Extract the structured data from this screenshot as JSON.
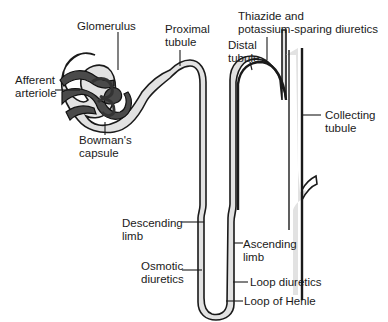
{
  "diagram": {
    "type": "anatomical-diagram",
    "labels": {
      "glomerulus": "Glomerulus",
      "proximal_1": "Proximal",
      "proximal_2": "tubule",
      "afferent_1": "Afferent",
      "afferent_2": "arteriole",
      "bowman_1": "Bowman's",
      "bowman_2": "capsule",
      "thiazide_1": "Thiazide and",
      "thiazide_2": "potassium-sparing diuretics",
      "distal_1": "Distal",
      "distal_2": "tubule",
      "collecting_1": "Collecting",
      "collecting_2": "tubule",
      "descending_1": "Descending",
      "descending_2": "limb",
      "ascending_1": "Ascending",
      "ascending_2": "limb",
      "osmotic_1": "Osmotic",
      "osmotic_2": "diuretics",
      "loop_diuretics": "Loop diuretics",
      "loop_henle": "Loop of Henle"
    },
    "colors": {
      "tubule_fill": "#e2e2e2",
      "outline": "#1a1a1a",
      "vessel": "#4a4a4a"
    }
  }
}
